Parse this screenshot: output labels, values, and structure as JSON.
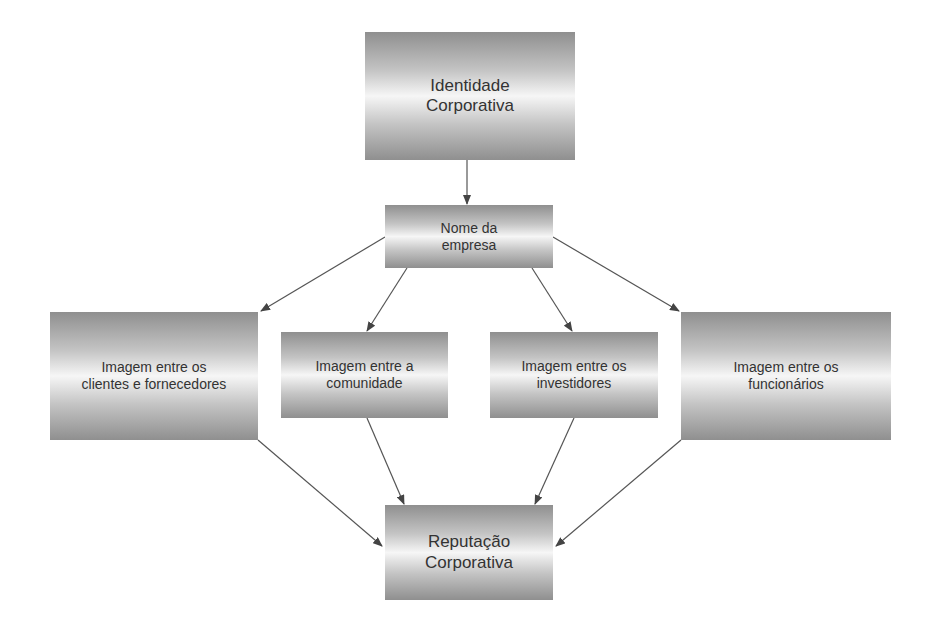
{
  "diagram": {
    "nodes": {
      "identidade": {
        "label": "Identidade\nCorporativa"
      },
      "nome": {
        "label": "Nome da\nempresa"
      },
      "clientes": {
        "label": "Imagem entre os\nclientes e fornecedores"
      },
      "comunidade": {
        "label": "Imagem entre a\ncomunidade"
      },
      "investidores": {
        "label": "Imagem entre os\ninvestidores"
      },
      "funcionarios": {
        "label": "Imagem entre os\nfuncionários"
      },
      "reputacao": {
        "label": "Reputação\nCorporativa"
      }
    },
    "edges": [
      {
        "from": "identidade",
        "to": "nome"
      },
      {
        "from": "nome",
        "to": "clientes"
      },
      {
        "from": "nome",
        "to": "comunidade"
      },
      {
        "from": "nome",
        "to": "investidores"
      },
      {
        "from": "nome",
        "to": "funcionarios"
      },
      {
        "from": "clientes",
        "to": "reputacao"
      },
      {
        "from": "comunidade",
        "to": "reputacao"
      },
      {
        "from": "investidores",
        "to": "reputacao"
      },
      {
        "from": "funcionarios",
        "to": "reputacao"
      }
    ],
    "colors": {
      "box_dark": "#8f8f8f",
      "box_light": "#f6f6f6",
      "text": "#333333",
      "arrow": "#444444"
    }
  }
}
